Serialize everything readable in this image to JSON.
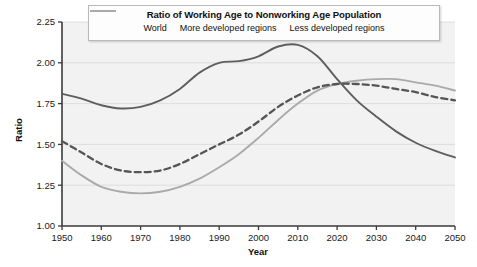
{
  "chart_data": {
    "type": "line",
    "title": "Ratio of Working Age to Nonworking Age Population",
    "xlabel": "Year",
    "ylabel": "Ratio",
    "xlim": [
      1950,
      2050
    ],
    "ylim": [
      1.0,
      2.25
    ],
    "xticks": [
      "1950",
      "1960",
      "1970",
      "1980",
      "1990",
      "2000",
      "2010",
      "2020",
      "2030",
      "2040",
      "2050"
    ],
    "yticks": [
      "1.00",
      "1.25",
      "1.50",
      "1.75",
      "2.00",
      "2.25"
    ],
    "grid": true,
    "legend_position": "top",
    "x": [
      1950,
      1955,
      1960,
      1965,
      1970,
      1975,
      1980,
      1985,
      1990,
      1995,
      2000,
      2005,
      2010,
      2015,
      2020,
      2025,
      2030,
      2035,
      2040,
      2045,
      2050
    ],
    "series": [
      {
        "name": "World",
        "style": "dashed",
        "color": "#555555",
        "values": [
          1.52,
          1.45,
          1.38,
          1.34,
          1.33,
          1.34,
          1.38,
          1.44,
          1.5,
          1.56,
          1.64,
          1.73,
          1.8,
          1.85,
          1.87,
          1.87,
          1.86,
          1.84,
          1.82,
          1.79,
          1.77
        ]
      },
      {
        "name": "More developed regions",
        "style": "solid",
        "color": "#5e5e5e",
        "values": [
          1.81,
          1.78,
          1.74,
          1.72,
          1.73,
          1.77,
          1.84,
          1.94,
          2.0,
          2.01,
          2.04,
          2.1,
          2.11,
          2.04,
          1.9,
          1.77,
          1.67,
          1.58,
          1.51,
          1.46,
          1.42
        ]
      },
      {
        "name": "Less developed regions",
        "style": "solid",
        "color": "#aaaaaa",
        "values": [
          1.4,
          1.31,
          1.24,
          1.21,
          1.2,
          1.21,
          1.24,
          1.29,
          1.36,
          1.44,
          1.54,
          1.65,
          1.75,
          1.83,
          1.87,
          1.89,
          1.9,
          1.9,
          1.88,
          1.86,
          1.83
        ]
      }
    ]
  },
  "legend": {
    "title": "Ratio of Working Age to Nonworking Age Population",
    "items": [
      {
        "label": "World"
      },
      {
        "label": "More developed regions"
      },
      {
        "label": "Less developed regions"
      }
    ]
  },
  "axes": {
    "y_title": "Ratio",
    "x_title": "Year"
  }
}
